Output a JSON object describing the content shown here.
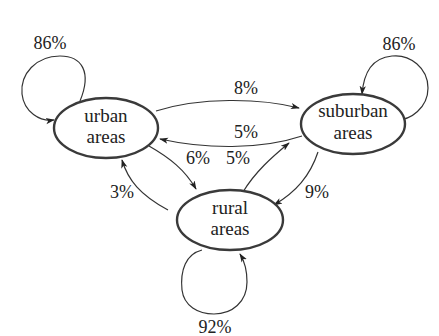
{
  "diagram": {
    "type": "state-transition",
    "nodes": [
      {
        "id": "urban",
        "line1": "urban",
        "line2": "areas"
      },
      {
        "id": "suburban",
        "line1": "suburban",
        "line2": "areas"
      },
      {
        "id": "rural",
        "line1": "rural",
        "line2": "areas"
      }
    ],
    "edges": [
      {
        "from": "urban",
        "to": "urban",
        "label": "86%"
      },
      {
        "from": "suburban",
        "to": "suburban",
        "label": "86%"
      },
      {
        "from": "rural",
        "to": "rural",
        "label": "92%"
      },
      {
        "from": "urban",
        "to": "suburban",
        "label": "8%"
      },
      {
        "from": "suburban",
        "to": "urban",
        "label": "5%"
      },
      {
        "from": "urban",
        "to": "rural",
        "label": "6%"
      },
      {
        "from": "rural",
        "to": "suburban",
        "label": "5%"
      },
      {
        "from": "rural",
        "to": "urban",
        "label": "3%"
      },
      {
        "from": "suburban",
        "to": "rural",
        "label": "9%"
      }
    ]
  }
}
